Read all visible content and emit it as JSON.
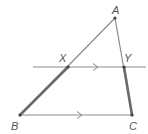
{
  "diagram": {
    "type": "geometry-triangle-parallel-lines",
    "points": {
      "A": {
        "label": "A",
        "x": 115,
        "y": 18
      },
      "B": {
        "label": "B",
        "x": 20,
        "y": 115
      },
      "C": {
        "label": "C",
        "x": 132,
        "y": 115
      },
      "X": {
        "label": "X",
        "x": 68,
        "y": 67
      },
      "Y": {
        "label": "Y",
        "x": 124,
        "y": 67
      }
    },
    "segments": [
      {
        "from": "A",
        "to": "B",
        "style": "thin"
      },
      {
        "from": "A",
        "to": "C",
        "style": "thin"
      },
      {
        "from": "B",
        "to": "C",
        "style": "thin",
        "parallel_mark": true
      },
      {
        "from": "B",
        "to": "X",
        "style": "thick"
      },
      {
        "from": "Y",
        "to": "C",
        "style": "thick"
      }
    ],
    "transversal_line": {
      "through": [
        "X",
        "Y"
      ],
      "x1": 33,
      "x2": 146,
      "y": 67,
      "parallel_mark": true
    },
    "colors": {
      "line": "#888888",
      "thick": "#666666",
      "point": "#444444",
      "label": "#555555"
    }
  }
}
